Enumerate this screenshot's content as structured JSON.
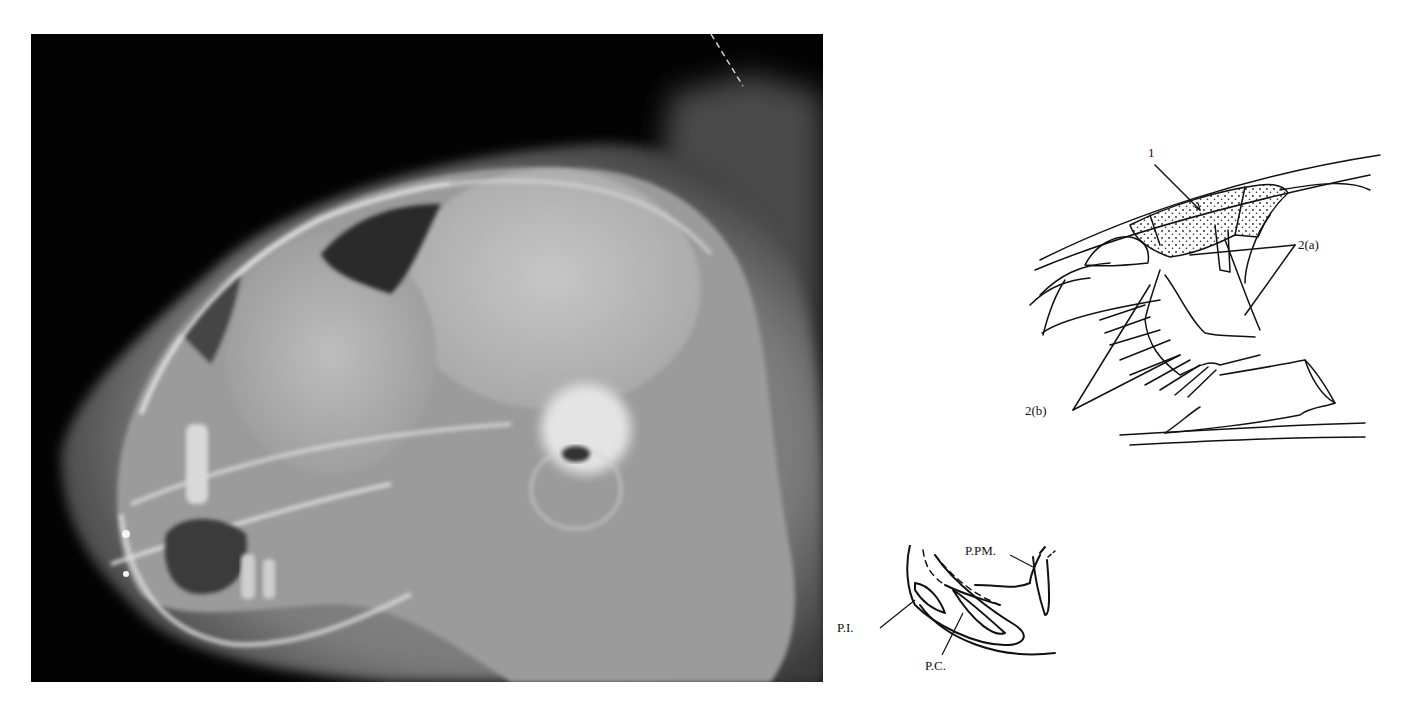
{
  "figure": {
    "radiograph": {
      "description": "Lateral radiograph of a skull (cat), showing frontal sinus, calvarium, tympanic bulla and dentition"
    },
    "sinus_diagram": {
      "labels": {
        "label_1": "1",
        "label_2a": "2(a)",
        "label_2b": "2(b)"
      }
    },
    "dental_diagram": {
      "labels": {
        "ppm": "P.PM.",
        "pi": "P.I.",
        "pc": "P.C."
      }
    }
  }
}
